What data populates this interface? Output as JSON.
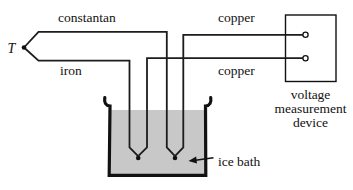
{
  "labels": {
    "junction_t": "T",
    "constantan": "constantan",
    "iron": "iron",
    "copper_top": "copper",
    "copper_bottom": "copper",
    "device_line1": "voltage",
    "device_line2": "measurement",
    "device_line3": "device",
    "ice_bath": "ice bath"
  },
  "colors": {
    "wire": "#1c1c1c",
    "bath_fill": "#c8c8c8",
    "ink": "#111111",
    "background": "#ffffff"
  }
}
